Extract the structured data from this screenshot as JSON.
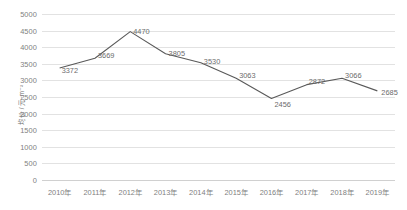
{
  "chart_data": {
    "type": "line",
    "title": "",
    "subtitle": "",
    "xlabel": "",
    "ylabel": "均价 / 元·m⁻²",
    "categories": [
      "2010年",
      "2011年",
      "2012年",
      "2013年",
      "2014年",
      "2015年",
      "2016年",
      "2017年",
      "2018年",
      "2019年"
    ],
    "values": [
      3372,
      3669,
      4470,
      3805,
      3530,
      3063,
      2456,
      2872,
      3066,
      2685
    ],
    "point_labels": [
      "3372",
      "3669",
      "4470",
      "3805",
      "3530",
      "3063",
      "2456",
      "2872",
      "3066",
      "2685"
    ],
    "ylim": [
      0,
      5000
    ],
    "ytick_labels": [
      "5000",
      "4500",
      "4000",
      "3500",
      "3000",
      "2500",
      "2000",
      "1500",
      "1000",
      "500",
      "0"
    ],
    "ytick_values": [
      5000,
      4500,
      4000,
      3500,
      3000,
      2500,
      2000,
      1500,
      1000,
      500,
      0
    ],
    "grid": "horizontal",
    "legend": "none",
    "series": [
      {
        "name": "均价",
        "color": "#595959",
        "values": [
          3372,
          3669,
          4470,
          3805,
          3530,
          3063,
          2456,
          2872,
          3066,
          2685
        ]
      }
    ]
  },
  "colors": {
    "line": "#595959",
    "grid": "#e2e2e2",
    "axis": "#d0d0d0",
    "tick_text": "#808080",
    "label_text": "#6b6b6b",
    "background": "#ffffff"
  }
}
